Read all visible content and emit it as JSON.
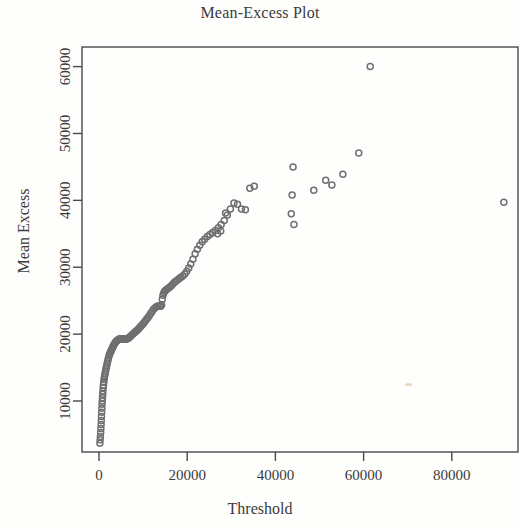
{
  "chart_data": {
    "type": "scatter",
    "title": "Mean-Excess Plot",
    "xlabel": "Threshold",
    "ylabel": "Mean Excess",
    "xlim": [
      -4000,
      95000
    ],
    "ylim": [
      2000,
      63500
    ],
    "xticks": [
      0,
      20000,
      40000,
      60000,
      80000
    ],
    "xtick_labels": [
      "0",
      "20000",
      "40000",
      "60000",
      "80000"
    ],
    "yticks": [
      10000,
      20000,
      30000,
      40000,
      50000,
      60000
    ],
    "ytick_labels": [
      "10000",
      "20000",
      "30000",
      "40000",
      "50000",
      "60000"
    ],
    "grid": false,
    "legend": null,
    "marker": "open-circle",
    "marker_color": "#6f6f6f",
    "marker_size": 6,
    "frame_color": "#4a4a4a",
    "points": [
      [
        200,
        3700
      ],
      [
        260,
        4200
      ],
      [
        320,
        4700
      ],
      [
        380,
        5300
      ],
      [
        430,
        5900
      ],
      [
        480,
        6500
      ],
      [
        520,
        7100
      ],
      [
        560,
        7700
      ],
      [
        610,
        8300
      ],
      [
        660,
        8900
      ],
      [
        700,
        9500
      ],
      [
        740,
        10000
      ],
      [
        790,
        10500
      ],
      [
        840,
        11000
      ],
      [
        890,
        11500
      ],
      [
        950,
        12000
      ],
      [
        1010,
        12400
      ],
      [
        1080,
        12800
      ],
      [
        1150,
        13200
      ],
      [
        1220,
        13500
      ],
      [
        1300,
        13800
      ],
      [
        1380,
        14100
      ],
      [
        1470,
        14400
      ],
      [
        1560,
        14700
      ],
      [
        1650,
        15000
      ],
      [
        1750,
        15300
      ],
      [
        1850,
        15600
      ],
      [
        1950,
        15900
      ],
      [
        2060,
        16200
      ],
      [
        2170,
        16500
      ],
      [
        2290,
        16800
      ],
      [
        2410,
        17000
      ],
      [
        2540,
        17200
      ],
      [
        2670,
        17400
      ],
      [
        2800,
        17600
      ],
      [
        2940,
        17800
      ],
      [
        3080,
        18000
      ],
      [
        3230,
        18200
      ],
      [
        3380,
        18400
      ],
      [
        3540,
        18600
      ],
      [
        3700,
        18750
      ],
      [
        3870,
        18900
      ],
      [
        4040,
        19000
      ],
      [
        4210,
        19100
      ],
      [
        4390,
        19200
      ],
      [
        4570,
        19250
      ],
      [
        4760,
        19300
      ],
      [
        4950,
        19300
      ],
      [
        5150,
        19300
      ],
      [
        5350,
        19300
      ],
      [
        5550,
        19300
      ],
      [
        5760,
        19250
      ],
      [
        5970,
        19250
      ],
      [
        6190,
        19250
      ],
      [
        6410,
        19300
      ],
      [
        6630,
        19400
      ],
      [
        6860,
        19500
      ],
      [
        7090,
        19650
      ],
      [
        7330,
        19800
      ],
      [
        7570,
        19950
      ],
      [
        7820,
        20100
      ],
      [
        8070,
        20250
      ],
      [
        8330,
        20400
      ],
      [
        8590,
        20550
      ],
      [
        8850,
        20700
      ],
      [
        9120,
        20900
      ],
      [
        9390,
        21100
      ],
      [
        9670,
        21300
      ],
      [
        9950,
        21500
      ],
      [
        10240,
        21750
      ],
      [
        10530,
        22000
      ],
      [
        10820,
        22250
      ],
      [
        11120,
        22500
      ],
      [
        11420,
        22800
      ],
      [
        11730,
        23100
      ],
      [
        12040,
        23400
      ],
      [
        12360,
        23700
      ],
      [
        12680,
        23900
      ],
      [
        13000,
        24100
      ],
      [
        13330,
        24200
      ],
      [
        13660,
        24200
      ],
      [
        14000,
        24150
      ],
      [
        14200,
        24400
      ],
      [
        14350,
        25200
      ],
      [
        14500,
        25800
      ],
      [
        14700,
        26200
      ],
      [
        14900,
        26400
      ],
      [
        15150,
        26550
      ],
      [
        15400,
        26700
      ],
      [
        15700,
        26850
      ],
      [
        16000,
        27000
      ],
      [
        16350,
        27200
      ],
      [
        16700,
        27450
      ],
      [
        17050,
        27700
      ],
      [
        17400,
        27900
      ],
      [
        17800,
        28100
      ],
      [
        18200,
        28300
      ],
      [
        18600,
        28500
      ],
      [
        19000,
        28700
      ],
      [
        19450,
        29000
      ],
      [
        19900,
        29400
      ],
      [
        20350,
        29900
      ],
      [
        20800,
        30500
      ],
      [
        21300,
        31200
      ],
      [
        21800,
        32000
      ],
      [
        22300,
        32700
      ],
      [
        22850,
        33300
      ],
      [
        23400,
        33800
      ],
      [
        23950,
        34200
      ],
      [
        24550,
        34600
      ],
      [
        25150,
        34900
      ],
      [
        25750,
        35200
      ],
      [
        26400,
        35500
      ],
      [
        27050,
        35900
      ],
      [
        27700,
        36400
      ],
      [
        28400,
        37000
      ],
      [
        29100,
        37800
      ],
      [
        29800,
        38700
      ],
      [
        30600,
        39600
      ],
      [
        26900,
        35000
      ],
      [
        27600,
        35400
      ],
      [
        28700,
        38100
      ],
      [
        31400,
        39400
      ],
      [
        32300,
        38700
      ],
      [
        33200,
        38600
      ],
      [
        34200,
        41800
      ],
      [
        35200,
        42100
      ],
      [
        43600,
        38000
      ],
      [
        43800,
        40800
      ],
      [
        44000,
        45000
      ],
      [
        44200,
        36400
      ],
      [
        48700,
        41500
      ],
      [
        51400,
        43000
      ],
      [
        52800,
        42300
      ],
      [
        55300,
        43900
      ],
      [
        58900,
        47100
      ],
      [
        61500,
        60000
      ],
      [
        91800,
        39700
      ]
    ]
  }
}
